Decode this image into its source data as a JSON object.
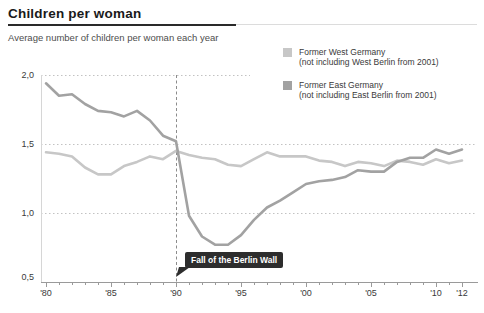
{
  "header": {
    "title": "Children per woman",
    "subtitle": "Average number of children per woman each year"
  },
  "legend": {
    "items": [
      {
        "label": "Former West Germany",
        "note": "(not including West Berlin from 2001)"
      },
      {
        "label": "Former East Germany",
        "note": "(not including East Berlin from 2001)"
      }
    ]
  },
  "annotation": {
    "label": "Fall of the Berlin Wall"
  },
  "chart_data": {
    "type": "line",
    "title": "Children per woman",
    "subtitle": "Average number of children per woman each year",
    "x": [
      1980,
      1981,
      1982,
      1983,
      1984,
      1985,
      1986,
      1987,
      1988,
      1989,
      1990,
      1991,
      1992,
      1993,
      1994,
      1995,
      1996,
      1997,
      1998,
      1999,
      2000,
      2001,
      2002,
      2003,
      2004,
      2005,
      2006,
      2007,
      2008,
      2009,
      2010,
      2011,
      2012
    ],
    "series": [
      {
        "name": "Former West Germany",
        "note": "(not including West Berlin from 2001)",
        "color": "#c7c7c7",
        "values": [
          1.44,
          1.43,
          1.41,
          1.33,
          1.28,
          1.28,
          1.34,
          1.37,
          1.41,
          1.39,
          1.45,
          1.42,
          1.4,
          1.39,
          1.35,
          1.34,
          1.39,
          1.44,
          1.41,
          1.41,
          1.41,
          1.38,
          1.37,
          1.34,
          1.37,
          1.36,
          1.34,
          1.38,
          1.37,
          1.35,
          1.39,
          1.36,
          1.38
        ]
      },
      {
        "name": "Former East Germany",
        "note": "(not including East Berlin from 2001)",
        "color": "#a2a2a2",
        "values": [
          1.94,
          1.85,
          1.86,
          1.79,
          1.74,
          1.73,
          1.7,
          1.74,
          1.67,
          1.56,
          1.52,
          0.98,
          0.83,
          0.77,
          0.77,
          0.84,
          0.95,
          1.04,
          1.09,
          1.15,
          1.21,
          1.23,
          1.24,
          1.26,
          1.31,
          1.3,
          1.3,
          1.37,
          1.4,
          1.4,
          1.46,
          1.43,
          1.46
        ]
      }
    ],
    "xlim": [
      1980,
      2012
    ],
    "ylim": [
      0.5,
      2.0
    ],
    "x_ticks": [
      {
        "x": 1980,
        "label": "'80"
      },
      {
        "x": 1985,
        "label": "'85"
      },
      {
        "x": 1990,
        "label": "'90"
      },
      {
        "x": 1995,
        "label": "'95"
      },
      {
        "x": 2000,
        "label": "'00"
      },
      {
        "x": 2005,
        "label": "'05"
      },
      {
        "x": 2010,
        "label": "'10"
      },
      {
        "x": 2012,
        "label": "'12"
      }
    ],
    "y_ticks": [
      {
        "v": 2.0,
        "label": "2,0"
      },
      {
        "v": 1.5,
        "label": "1,5"
      },
      {
        "v": 1.0,
        "label": "1,0"
      },
      {
        "v": 0.5,
        "label": "0,5"
      }
    ],
    "grid": "horizontal-dotted",
    "legend_position": "top-right",
    "marker_line": {
      "x": 1990,
      "style": "dashed",
      "label": "Fall of the Berlin Wall"
    }
  }
}
